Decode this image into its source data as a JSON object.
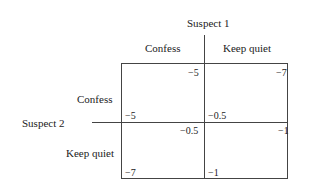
{
  "matrix": {
    "player1": {
      "label": "Suspect 1",
      "strategies": [
        "Confess",
        "Keep quiet"
      ]
    },
    "player2": {
      "label": "Suspect 2",
      "strategies": [
        "Confess",
        "Keep quiet"
      ]
    },
    "cells": [
      {
        "row": "Confess",
        "col": "Confess",
        "p1": "−5",
        "p2": "−5"
      },
      {
        "row": "Confess",
        "col": "Keep quiet",
        "p1": "−7",
        "p2": "−0.5"
      },
      {
        "row": "Keep quiet",
        "col": "Confess",
        "p1": "−0.5",
        "p2": "−7"
      },
      {
        "row": "Keep quiet",
        "col": "Keep quiet",
        "p1": "−1",
        "p2": "−1"
      }
    ]
  }
}
